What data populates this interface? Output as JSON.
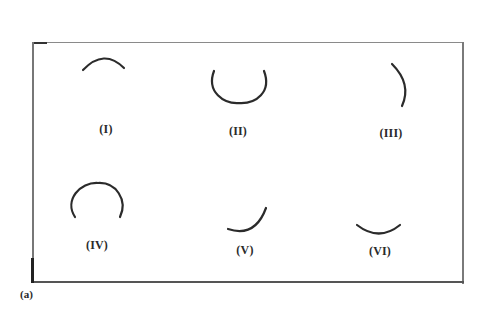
{
  "figure": {
    "caption": "(a)",
    "stroke_color": "#2b2b2b",
    "frame_color": "#777777",
    "panels": [
      {
        "id": "I",
        "label": "(I)",
        "shape": "upper arc (cap)",
        "path": "M83 70 Q104 48 124 68",
        "label_pos": [
          106,
          122
        ]
      },
      {
        "id": "II",
        "label": "(II)",
        "shape": "U-shaped arc (open top)",
        "path": "M214 71 C206 92 224 104 239 103 C256 104 272 92 264 71",
        "label_pos": [
          238,
          124
        ]
      },
      {
        "id": "III",
        "label": "(III)",
        "shape": "right-bulging arc",
        "path": "M392 64 Q412 84 402 106",
        "label_pos": [
          391,
          126
        ]
      },
      {
        "id": "IV",
        "label": "(IV)",
        "shape": "arch (open bottom)",
        "path": "M75 217 C64 200 80 182 98 183 C116 182 128 200 120 217",
        "label_pos": [
          97,
          238
        ]
      },
      {
        "id": "V",
        "label": "(V)",
        "shape": "lower-right quarter arc",
        "path": "M228 229 Q255 238 266 208",
        "label_pos": [
          245,
          243
        ]
      },
      {
        "id": "VI",
        "label": "(VI)",
        "shape": "shallow smile arc",
        "path": "M357 225 Q379 242 400 225",
        "label_pos": [
          380,
          244
        ]
      }
    ]
  }
}
